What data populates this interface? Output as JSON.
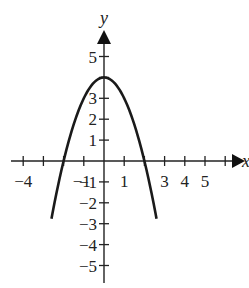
{
  "chart_data": {
    "type": "line",
    "title": "",
    "xlabel": "x",
    "ylabel": "y",
    "xlim": [
      -5,
      6
    ],
    "ylim": [
      -5,
      5
    ],
    "grid": false,
    "x_tick_labels": [
      "-4",
      "-1",
      "1",
      "3",
      "4",
      "5"
    ],
    "y_tick_labels": [
      "5",
      "3",
      "2",
      "1",
      "-1",
      "-2",
      "-3",
      "-4",
      "-5"
    ],
    "series": [
      {
        "name": "parabola",
        "equation": "y = 4 - x^2",
        "vertex": [
          0,
          4
        ],
        "x_intercepts": [
          -2,
          2
        ],
        "x": [
          -2.6,
          -2,
          -1.5,
          -1,
          -0.5,
          0,
          0.5,
          1,
          1.5,
          2,
          2.6
        ],
        "values": [
          -2.76,
          0,
          1.75,
          3,
          3.75,
          4,
          3.75,
          3,
          1.75,
          0,
          -2.76
        ]
      }
    ]
  },
  "colors": {
    "curve": "#1a1a1a",
    "axis": "#222222"
  }
}
